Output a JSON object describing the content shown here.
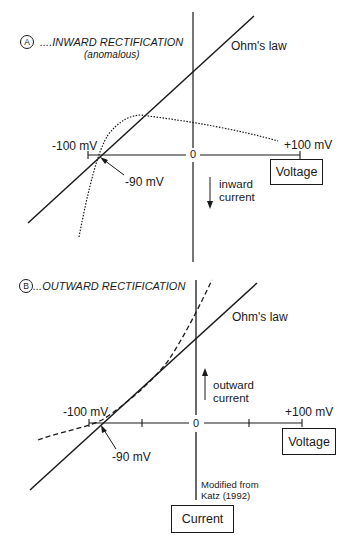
{
  "panel_a": {
    "badge": "A",
    "title": "....INWARD RECTIFICATION",
    "subtitle": "(anomalous)",
    "ohms_law_label": "Ohm's law",
    "x_min_label": "-100 mV",
    "x_max_label": "+100 mV",
    "origin_label": "0",
    "reversal_label": "-90 mV",
    "voltage_box": "Voltage",
    "current_direction_line1": "inward",
    "current_direction_line2": "current"
  },
  "panel_b": {
    "badge": "B",
    "title": "...OUTWARD RECTIFICATION",
    "ohms_law_label": "Ohm's law",
    "x_min_label": "-100 mV",
    "x_max_label": "+100 mV",
    "origin_label": "0",
    "reversal_label": "-90 mV",
    "voltage_box": "Voltage",
    "current_direction_line1": "outward",
    "current_direction_line2": "current",
    "credit_line1": "Modified from",
    "credit_line2": "Katz (1992)",
    "current_box": "Current"
  },
  "colors": {
    "ink": "#1a1a1a",
    "background": "#ffffff"
  }
}
